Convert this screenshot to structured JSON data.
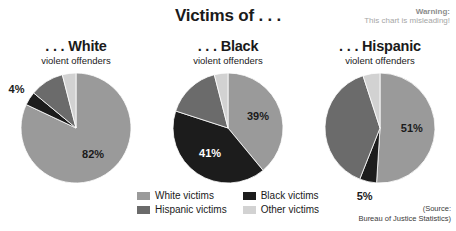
{
  "header": {
    "title": "Victims of . . .",
    "warning_title": "Warning:",
    "warning_text": "This chart is misleading!"
  },
  "colors": {
    "white_victims": "#9a9a9a",
    "black_victims": "#1c1c1c",
    "hispanic_victims": "#6b6b6b",
    "other_victims": "#d2d2d2",
    "text": "#1a1a1a",
    "warning": "#a6a6a6"
  },
  "legend": {
    "items": [
      {
        "label": "White victims",
        "color": "#9a9a9a"
      },
      {
        "label": "Black victims",
        "color": "#1c1c1c"
      },
      {
        "label": "Hispanic victims",
        "color": "#6b6b6b"
      },
      {
        "label": "Other victims",
        "color": "#d2d2d2"
      }
    ]
  },
  "source": {
    "line1": "(Source:",
    "line2": "Bureau of Justice Statistics)"
  },
  "chart_data": {
    "type": "pie",
    "title": "Victims of . . .",
    "subtitle": "",
    "xlabel": "",
    "ylabel": "",
    "legend_position": "bottom",
    "grid": false,
    "annotations": [
      "Warning: This chart is misleading!",
      "(Source: Bureau of Justice Statistics)"
    ],
    "categories": [
      "White victims",
      "Black victims",
      "Hispanic victims",
      "Other victims"
    ],
    "charts": [
      {
        "title": ". . . White",
        "subtitle": "violent offenders",
        "values": [
          82,
          4,
          10,
          4
        ],
        "labels": [
          "82%",
          "4%",
          "",
          ""
        ],
        "visible_labels": [
          "82%",
          "4%"
        ]
      },
      {
        "title": ". . . Black",
        "subtitle": "violent offenders",
        "values": [
          39,
          41,
          16,
          4
        ],
        "labels": [
          "39%",
          "41%",
          "",
          ""
        ],
        "visible_labels": [
          "39%",
          "41%"
        ]
      },
      {
        "title": ". . . Hispanic",
        "subtitle": "violent offenders",
        "values": [
          51,
          5,
          39,
          5
        ],
        "labels": [
          "51%",
          "5%",
          "",
          ""
        ],
        "visible_labels": [
          "51%",
          "5%"
        ]
      }
    ]
  }
}
